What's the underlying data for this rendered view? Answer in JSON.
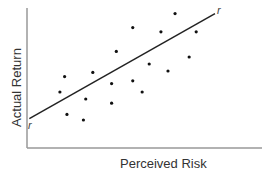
{
  "chart_data": {
    "type": "scatter",
    "title": "",
    "xlabel": "Perceived Risk",
    "ylabel": "Actual Return",
    "xlim": [
      0,
      100
    ],
    "ylim": [
      0,
      100
    ],
    "grid": false,
    "legend": null,
    "points": [
      {
        "x": 16,
        "y": 51
      },
      {
        "x": 28,
        "y": 54
      },
      {
        "x": 38,
        "y": 69
      },
      {
        "x": 45,
        "y": 86
      },
      {
        "x": 57,
        "y": 83
      },
      {
        "x": 63,
        "y": 96
      },
      {
        "x": 72,
        "y": 83
      },
      {
        "x": 52,
        "y": 60
      },
      {
        "x": 14,
        "y": 40
      },
      {
        "x": 25,
        "y": 35
      },
      {
        "x": 17,
        "y": 24
      },
      {
        "x": 24,
        "y": 20
      },
      {
        "x": 36,
        "y": 46
      },
      {
        "x": 45,
        "y": 48
      },
      {
        "x": 49,
        "y": 40
      },
      {
        "x": 36,
        "y": 32
      },
      {
        "x": 60,
        "y": 55
      },
      {
        "x": 69,
        "y": 65
      }
    ],
    "trend_line": {
      "label": "r",
      "start": {
        "x": 1,
        "y": 21
      },
      "end": {
        "x": 80,
        "y": 96
      }
    }
  },
  "labels": {
    "xlabel": "Perceived Risk",
    "ylabel": "Actual Return",
    "line_start_label": "r",
    "line_end_label": "r"
  }
}
